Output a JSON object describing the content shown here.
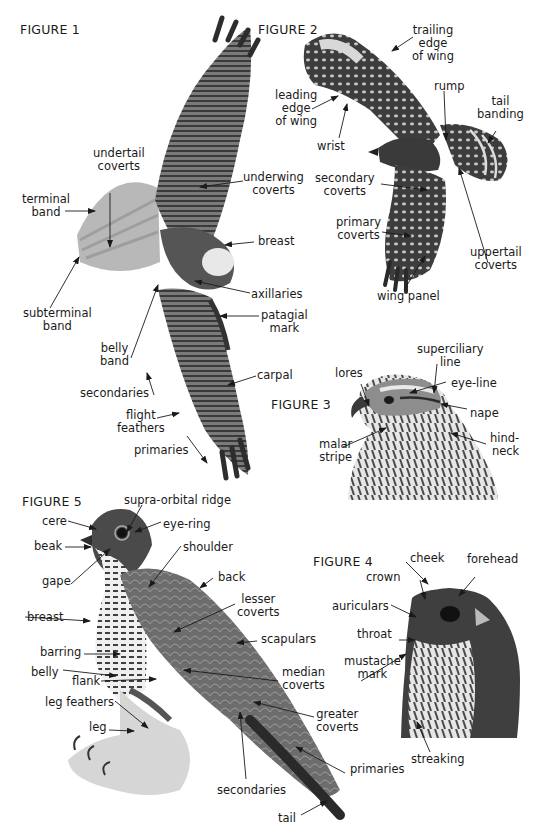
{
  "figures": [
    {
      "id": "figure-1",
      "title": "FIGURE 1",
      "title_pos": [
        20,
        22
      ],
      "subject": "hawk-underside-in-flight",
      "labels": [
        {
          "text": [
            "undertail",
            "coverts"
          ],
          "x": 93,
          "y": 147,
          "align": "c"
        },
        {
          "text": [
            "terminal",
            "band"
          ],
          "x": 22,
          "y": 193,
          "align": "c"
        },
        {
          "text": [
            "underwing",
            "coverts"
          ],
          "x": 243,
          "y": 171,
          "align": "c"
        },
        {
          "text": [
            "breast"
          ],
          "x": 258,
          "y": 235,
          "align": "l"
        },
        {
          "text": [
            "subterminal",
            "band"
          ],
          "x": 23,
          "y": 307,
          "align": "c"
        },
        {
          "text": [
            "axillaries"
          ],
          "x": 251,
          "y": 288,
          "align": "l"
        },
        {
          "text": [
            "patagial",
            "mark"
          ],
          "x": 261,
          "y": 309,
          "align": "c"
        },
        {
          "text": [
            "belly",
            "band"
          ],
          "x": 100,
          "y": 342,
          "align": "c"
        },
        {
          "text": [
            "carpal"
          ],
          "x": 257,
          "y": 369,
          "align": "l"
        },
        {
          "text": [
            "secondaries"
          ],
          "x": 80,
          "y": 387,
          "align": "l"
        },
        {
          "text": [
            "flight",
            "feathers"
          ],
          "x": 117,
          "y": 409,
          "align": "c"
        },
        {
          "text": [
            "primaries"
          ],
          "x": 134,
          "y": 444,
          "align": "l"
        }
      ]
    },
    {
      "id": "figure-2",
      "title": "FIGURE 2",
      "title_pos": [
        258,
        22
      ],
      "subject": "hawk-upperside-in-flight",
      "labels": [
        {
          "text": [
            "trailing",
            "edge",
            "of wing"
          ],
          "x": 412,
          "y": 24,
          "align": "c"
        },
        {
          "text": [
            "leading",
            "edge",
            "of wing"
          ],
          "x": 275,
          "y": 89,
          "align": "c"
        },
        {
          "text": [
            "rump"
          ],
          "x": 434,
          "y": 80,
          "align": "l"
        },
        {
          "text": [
            "tail",
            "banding"
          ],
          "x": 477,
          "y": 95,
          "align": "c"
        },
        {
          "text": [
            "wrist"
          ],
          "x": 317,
          "y": 140,
          "align": "l"
        },
        {
          "text": [
            "secondary",
            "coverts"
          ],
          "x": 315,
          "y": 172,
          "align": "c"
        },
        {
          "text": [
            "primary",
            "coverts"
          ],
          "x": 336,
          "y": 216,
          "align": "c"
        },
        {
          "text": [
            "uppertail",
            "coverts"
          ],
          "x": 470,
          "y": 246,
          "align": "c"
        },
        {
          "text": [
            "wing panel"
          ],
          "x": 377,
          "y": 290,
          "align": "l"
        }
      ]
    },
    {
      "id": "figure-3",
      "title": "FIGURE 3",
      "title_pos": [
        271,
        397
      ],
      "subject": "hawk-head-profile",
      "labels": [
        {
          "text": [
            "superciliary",
            "line"
          ],
          "x": 417,
          "y": 343,
          "align": "c"
        },
        {
          "text": [
            "lores"
          ],
          "x": 335,
          "y": 367,
          "align": "l"
        },
        {
          "text": [
            "eye-line"
          ],
          "x": 451,
          "y": 377,
          "align": "l"
        },
        {
          "text": [
            "nape"
          ],
          "x": 470,
          "y": 407,
          "align": "l"
        },
        {
          "text": [
            "malar",
            "stripe"
          ],
          "x": 319,
          "y": 438,
          "align": "c"
        },
        {
          "text": [
            "hind-",
            "neck"
          ],
          "x": 490,
          "y": 432,
          "align": "r"
        }
      ]
    },
    {
      "id": "figure-5",
      "title": "FIGURE 5",
      "title_pos": [
        22,
        494
      ],
      "subject": "falcon-perched",
      "labels": [
        {
          "text": [
            "supra-orbital ridge"
          ],
          "x": 124,
          "y": 494,
          "align": "l"
        },
        {
          "text": [
            "cere"
          ],
          "x": 42,
          "y": 515,
          "align": "l"
        },
        {
          "text": [
            "eye-ring"
          ],
          "x": 163,
          "y": 518,
          "align": "l"
        },
        {
          "text": [
            "beak"
          ],
          "x": 34,
          "y": 540,
          "align": "l"
        },
        {
          "text": [
            "shoulder"
          ],
          "x": 183,
          "y": 541,
          "align": "l"
        },
        {
          "text": [
            "gape"
          ],
          "x": 42,
          "y": 575,
          "align": "l"
        },
        {
          "text": [
            "back"
          ],
          "x": 218,
          "y": 571,
          "align": "l"
        },
        {
          "text": [
            "lesser",
            "coverts"
          ],
          "x": 237,
          "y": 593,
          "align": "c"
        },
        {
          "text": [
            "breast"
          ],
          "x": 27,
          "y": 611,
          "align": "l"
        },
        {
          "text": [
            "scapulars"
          ],
          "x": 261,
          "y": 633,
          "align": "l"
        },
        {
          "text": [
            "barring"
          ],
          "x": 40,
          "y": 646,
          "align": "l"
        },
        {
          "text": [
            "belly"
          ],
          "x": 31,
          "y": 666,
          "align": "l"
        },
        {
          "text": [
            "flank"
          ],
          "x": 72,
          "y": 675,
          "align": "l"
        },
        {
          "text": [
            "median",
            "coverts"
          ],
          "x": 282,
          "y": 666,
          "align": "c"
        },
        {
          "text": [
            "leg feathers"
          ],
          "x": 45,
          "y": 696,
          "align": "l"
        },
        {
          "text": [
            "greater",
            "coverts"
          ],
          "x": 316,
          "y": 708,
          "align": "c"
        },
        {
          "text": [
            "leg"
          ],
          "x": 89,
          "y": 721,
          "align": "l"
        },
        {
          "text": [
            "primaries"
          ],
          "x": 350,
          "y": 763,
          "align": "l"
        },
        {
          "text": [
            "secondaries"
          ],
          "x": 217,
          "y": 784,
          "align": "l"
        },
        {
          "text": [
            "tail"
          ],
          "x": 278,
          "y": 812,
          "align": "l"
        }
      ]
    },
    {
      "id": "figure-4",
      "title": "FIGURE 4",
      "title_pos": [
        313,
        554
      ],
      "subject": "merlin-head",
      "labels": [
        {
          "text": [
            "cheek"
          ],
          "x": 410,
          "y": 552,
          "align": "l"
        },
        {
          "text": [
            "forehead"
          ],
          "x": 467,
          "y": 553,
          "align": "l"
        },
        {
          "text": [
            "crown"
          ],
          "x": 366,
          "y": 571,
          "align": "l"
        },
        {
          "text": [
            "auriculars"
          ],
          "x": 332,
          "y": 600,
          "align": "l"
        },
        {
          "text": [
            "throat"
          ],
          "x": 357,
          "y": 628,
          "align": "l"
        },
        {
          "text": [
            "mustache",
            "mark"
          ],
          "x": 344,
          "y": 655,
          "align": "c"
        },
        {
          "text": [
            "streaking"
          ],
          "x": 411,
          "y": 753,
          "align": "l"
        }
      ]
    }
  ],
  "arrows": [
    [
      65,
      211,
      95,
      211
    ],
    [
      110,
      193,
      110,
      247
    ],
    [
      243,
      181,
      200,
      187
    ],
    [
      254,
      242,
      225,
      245
    ],
    [
      50,
      308,
      79,
      257
    ],
    [
      250,
      293,
      195,
      281
    ],
    [
      259,
      316,
      220,
      316
    ],
    [
      131,
      358,
      158,
      285
    ],
    [
      256,
      376,
      228,
      385
    ],
    [
      154,
      395,
      147,
      373
    ],
    [
      157,
      418,
      179,
      413
    ],
    [
      187,
      436,
      207,
      463
    ],
    [
      413,
      37,
      392,
      51
    ],
    [
      312,
      109,
      338,
      96
    ],
    [
      444,
      91,
      446,
      140
    ],
    [
      496,
      131,
      488,
      143
    ],
    [
      339,
      138,
      347,
      104
    ],
    [
      381,
      184,
      427,
      190
    ],
    [
      382,
      232,
      411,
      236
    ],
    [
      404,
      290,
      425,
      256
    ],
    [
      488,
      263,
      459,
      168
    ],
    [
      437,
      364,
      434,
      393
    ],
    [
      361,
      384,
      369,
      406
    ],
    [
      446,
      382,
      410,
      393
    ],
    [
      467,
      409,
      441,
      404
    ],
    [
      486,
      444,
      451,
      433
    ],
    [
      343,
      447,
      386,
      428
    ],
    [
      142,
      505,
      127,
      532
    ],
    [
      68,
      521,
      96,
      529
    ],
    [
      161,
      522,
      135,
      532
    ],
    [
      65,
      547,
      91,
      547
    ],
    [
      181,
      546,
      149,
      587
    ],
    [
      71,
      584,
      110,
      549
    ],
    [
      213,
      578,
      200,
      588
    ],
    [
      235,
      604,
      174,
      632
    ],
    [
      25,
      617,
      90,
      621
    ],
    [
      257,
      641,
      237,
      643
    ],
    [
      84,
      654,
      120,
      654
    ],
    [
      63,
      670,
      116,
      676
    ],
    [
      101,
      681,
      156,
      679
    ],
    [
      278,
      681,
      184,
      670
    ],
    [
      115,
      701,
      148,
      728
    ],
    [
      314,
      717,
      254,
      702
    ],
    [
      109,
      730,
      134,
      731
    ],
    [
      345,
      773,
      296,
      747
    ],
    [
      246,
      779,
      240,
      712
    ],
    [
      301,
      815,
      327,
      801
    ],
    [
      406,
      562,
      428,
      584
    ],
    [
      420,
      580,
      425,
      599
    ],
    [
      475,
      577,
      459,
      596
    ],
    [
      391,
      605,
      416,
      617
    ],
    [
      399,
      640,
      415,
      640
    ],
    [
      361,
      681,
      406,
      654
    ],
    [
      430,
      752,
      417,
      722
    ]
  ],
  "colors": {
    "background": "#ffffff",
    "text": "#1a1a1a",
    "arrow": "#1a1a1a"
  }
}
